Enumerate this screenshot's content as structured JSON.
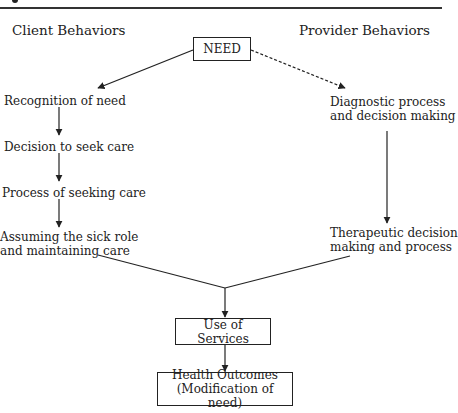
{
  "headings": {
    "left": "Client Behaviors",
    "right": "Provider Behaviors"
  },
  "nodes": {
    "need": "NEED",
    "client": [
      [
        "Recognition of need"
      ],
      [
        "Decision to seek care"
      ],
      [
        "Process of seeking care"
      ],
      [
        "Assuming the sick role",
        "and maintaining care"
      ]
    ],
    "provider": [
      [
        "Diagnostic process",
        "and decision making"
      ],
      [
        "Therapeutic decision",
        "making and process"
      ]
    ],
    "use_of_services": "Use of Services",
    "outcomes": [
      "Health Outcomes",
      "(Modification of need)"
    ]
  },
  "edges": [
    {
      "from": "NEED",
      "to": "Recognition of need",
      "style": "solid"
    },
    {
      "from": "NEED",
      "to": "Diagnostic process and decision making",
      "style": "dashed"
    },
    {
      "from": "Recognition of need",
      "to": "Decision to seek care",
      "style": "solid"
    },
    {
      "from": "Decision to seek care",
      "to": "Process of seeking care",
      "style": "solid"
    },
    {
      "from": "Process of seeking care",
      "to": "Assuming the sick role and maintaining care",
      "style": "solid"
    },
    {
      "from": "Diagnostic process and decision making",
      "to": "Therapeutic decision making and process",
      "style": "solid"
    },
    {
      "from": "Assuming the sick role and maintaining care",
      "to": "Use of Services",
      "style": "solid"
    },
    {
      "from": "Therapeutic decision making and process",
      "to": "Use of Services",
      "style": "solid"
    },
    {
      "from": "Use of Services",
      "to": "Health Outcomes (Modification of need)",
      "style": "solid"
    }
  ]
}
